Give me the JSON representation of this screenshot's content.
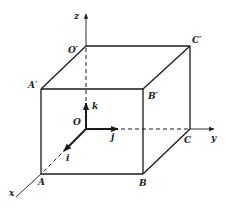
{
  "diagram": {
    "axes": {
      "x": "x",
      "y": "y",
      "z": "z"
    },
    "origin_label": "O",
    "vertices": {
      "O": "O",
      "A": "A",
      "B": "B",
      "C": "C",
      "O_prime": "O′",
      "A_prime": "A′",
      "B_prime": "B′",
      "C_prime": "C′"
    },
    "unit_vectors": {
      "i": "i",
      "j": "j",
      "k": "k"
    },
    "edges": [
      [
        "A",
        "B"
      ],
      [
        "B",
        "C"
      ],
      [
        "A",
        "A′"
      ],
      [
        "B",
        "B′"
      ],
      [
        "C",
        "C′"
      ],
      [
        "A′",
        "B′"
      ],
      [
        "B′",
        "C′"
      ],
      [
        "O′",
        "C′"
      ],
      [
        "O′",
        "A′"
      ]
    ],
    "hidden_edges": [
      [
        "O",
        "A"
      ],
      [
        "O",
        "C"
      ],
      [
        "O",
        "O′"
      ]
    ],
    "colors": {
      "ink": "#1a1a1a",
      "background": "#ffffff"
    }
  }
}
